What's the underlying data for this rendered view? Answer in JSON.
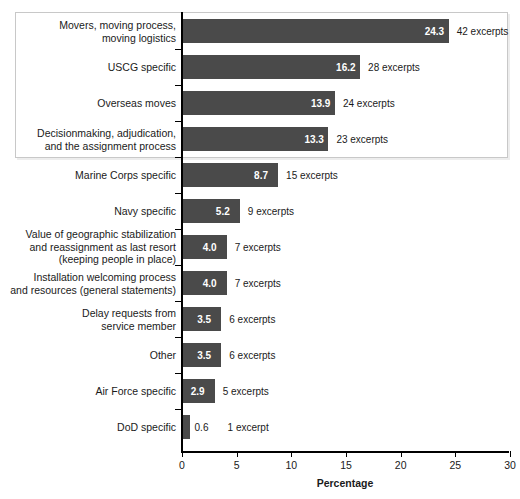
{
  "chart_data": {
    "type": "bar",
    "orientation": "horizontal",
    "title": "",
    "xlabel": "Percentage",
    "ylabel": "",
    "xlim": [
      0,
      30
    ],
    "xticks": [
      0,
      5,
      10,
      15,
      20,
      25,
      30
    ],
    "grid": false,
    "legend": null,
    "bar_color": "#4a4a4a",
    "categories": [
      "Movers, moving process,\nmoving logistics",
      "USCG specific",
      "Overseas moves",
      "Decisionmaking, adjudication,\nand the assignment process",
      "Marine Corps specific",
      "Navy specific",
      "Value of geographic stabilization\nand reassignment as last resort\n(keeping people in place)",
      "Installation welcoming process\nand resources (general statements)",
      "Delay requests from\nservice member",
      "Other",
      "Air Force specific",
      "DoD specific"
    ],
    "values": [
      24.3,
      16.2,
      13.9,
      13.3,
      8.7,
      5.2,
      4.0,
      4.0,
      3.5,
      3.5,
      2.9,
      0.6
    ],
    "value_labels": [
      "24.3",
      "16.2",
      "13.9",
      "13.3",
      "8.7",
      "5.2",
      "4.0",
      "4.0",
      "3.5",
      "3.5",
      "2.9",
      "0.6"
    ],
    "annotations": [
      "42 excerpts",
      "28 excerpts",
      "24 excerpts",
      "23 excerpts",
      "15 excerpts",
      "9 excerpts",
      "7 excerpts",
      "7 excerpts",
      "6 excerpts",
      "6 excerpts",
      "5 excerpts",
      "1 excerpt"
    ],
    "excerpt_counts": [
      42,
      28,
      24,
      23,
      15,
      9,
      7,
      7,
      6,
      6,
      5,
      1
    ],
    "highlight": {
      "label": "highlight-box",
      "covers_categories": [
        0,
        1,
        2,
        3
      ],
      "border_color": "#c8c8c8"
    }
  }
}
